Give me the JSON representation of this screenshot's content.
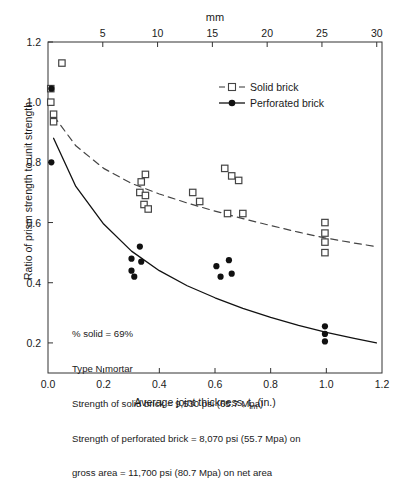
{
  "chart_data": {
    "type": "scatter",
    "title": "",
    "xlabel": "Average joint thickness, t_m(in.)",
    "xlabel_main": "Average joint thickness, t",
    "xlabel_sub": "m",
    "xlabel_tail": "(in.)",
    "ylabel": "Ratio of prism strength to unit strength",
    "top_axis_label": "mm",
    "xlim": [
      0.0,
      1.2
    ],
    "ylim": [
      0.1,
      1.2
    ],
    "xticks": [
      0.0,
      0.2,
      0.4,
      0.6,
      0.8,
      1.0,
      1.2
    ],
    "xticklabels": [
      "0.0",
      "0.2",
      "0.4",
      "0.6",
      "0.8",
      "1.0",
      "1.2"
    ],
    "yticks": [
      0.2,
      0.4,
      0.6,
      0.8,
      1.0,
      1.2
    ],
    "yticklabels": [
      "0.2",
      "0.4",
      "0.6",
      "0.8",
      "1.0",
      "1.2"
    ],
    "top_ticks_mm": [
      5,
      10,
      15,
      20,
      25,
      30
    ],
    "top_ticklabels": [
      "5",
      "10",
      "15",
      "20",
      "25",
      "30"
    ],
    "mm_per_inch": 25.4,
    "grid": false,
    "legend_position": "upper-right-inside",
    "series": [
      {
        "name": "Solid brick",
        "marker": "open-square",
        "line": "dashed",
        "color": "#444444",
        "points": [
          [
            0.01,
            1.045
          ],
          [
            0.01,
            1.0
          ],
          [
            0.02,
            0.96
          ],
          [
            0.02,
            0.935
          ],
          [
            0.05,
            1.13
          ],
          [
            0.335,
            0.735
          ],
          [
            0.35,
            0.76
          ],
          [
            0.33,
            0.7
          ],
          [
            0.35,
            0.69
          ],
          [
            0.345,
            0.66
          ],
          [
            0.36,
            0.645
          ],
          [
            0.52,
            0.7
          ],
          [
            0.545,
            0.67
          ],
          [
            0.635,
            0.78
          ],
          [
            0.66,
            0.755
          ],
          [
            0.685,
            0.74
          ],
          [
            0.645,
            0.63
          ],
          [
            0.7,
            0.63
          ],
          [
            0.995,
            0.6
          ],
          [
            0.995,
            0.565
          ],
          [
            0.995,
            0.535
          ],
          [
            0.995,
            0.5
          ]
        ]
      },
      {
        "name": "Perforated brick",
        "marker": "filled-circle",
        "line": "solid",
        "color": "#111111",
        "points": [
          [
            0.012,
            1.045
          ],
          [
            0.012,
            0.8
          ],
          [
            0.3,
            0.48
          ],
          [
            0.3,
            0.44
          ],
          [
            0.31,
            0.42
          ],
          [
            0.33,
            0.52
          ],
          [
            0.335,
            0.47
          ],
          [
            0.605,
            0.455
          ],
          [
            0.62,
            0.42
          ],
          [
            0.65,
            0.475
          ],
          [
            0.66,
            0.43
          ],
          [
            0.995,
            0.255
          ],
          [
            0.995,
            0.23
          ],
          [
            0.995,
            0.205
          ]
        ]
      }
    ],
    "fit_curves": [
      {
        "name": "Solid brick fit",
        "style": "dashed",
        "points": [
          [
            0.02,
            0.955
          ],
          [
            0.1,
            0.855
          ],
          [
            0.2,
            0.78
          ],
          [
            0.3,
            0.73
          ],
          [
            0.4,
            0.695
          ],
          [
            0.5,
            0.665
          ],
          [
            0.6,
            0.638
          ],
          [
            0.7,
            0.613
          ],
          [
            0.8,
            0.59
          ],
          [
            0.9,
            0.568
          ],
          [
            1.0,
            0.548
          ],
          [
            1.1,
            0.532
          ],
          [
            1.18,
            0.52
          ]
        ]
      },
      {
        "name": "Perforated brick fit",
        "style": "solid",
        "points": [
          [
            0.02,
            0.88
          ],
          [
            0.1,
            0.72
          ],
          [
            0.2,
            0.595
          ],
          [
            0.3,
            0.505
          ],
          [
            0.4,
            0.44
          ],
          [
            0.5,
            0.39
          ],
          [
            0.6,
            0.35
          ],
          [
            0.7,
            0.315
          ],
          [
            0.8,
            0.285
          ],
          [
            0.9,
            0.258
          ],
          [
            1.0,
            0.235
          ],
          [
            1.1,
            0.215
          ],
          [
            1.18,
            0.2
          ]
        ]
      }
    ],
    "legend": [
      {
        "label": "Solid brick",
        "marker": "open-square",
        "line": "dashed"
      },
      {
        "label": "Perforated brick",
        "marker": "filled-circle",
        "line": "solid"
      }
    ],
    "annotations": [
      "% solid  =  69%",
      "Type N mortar",
      "Strength of solid brick  =  9,530 psi (65.7 Mpa)",
      "Strength of perforated brick  =  8,070 psi (55.7 Mpa) on",
      "gross area  =  11,700 psi (80.7 Mpa) on net area"
    ]
  },
  "colors": {
    "axis": "#333333",
    "solid_brick": "#444444",
    "perforated_brick": "#111111",
    "background": "#ffffff"
  }
}
